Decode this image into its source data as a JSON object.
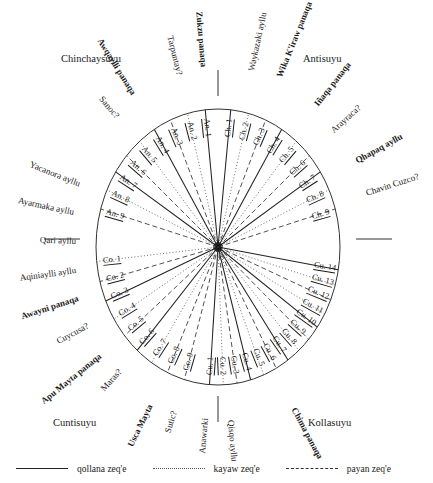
{
  "diagram": {
    "center": {
      "x": 218,
      "y": 247
    },
    "ellipse": {
      "rx": 122,
      "ry": 138
    },
    "colors": {
      "qollana": "#222222",
      "kayaw": "#555555",
      "payan": "#333333",
      "outline": "#333333",
      "text": "#1a1a1a"
    },
    "tick_marks": [
      {
        "name": "tick-top",
        "x1": 218,
        "y1": 70,
        "x2": 218,
        "y2": 96
      },
      {
        "name": "tick-left",
        "x1": 44,
        "y1": 239,
        "x2": 80,
        "y2": 239
      },
      {
        "name": "tick-right",
        "x1": 356,
        "y1": 239,
        "x2": 392,
        "y2": 239
      },
      {
        "name": "tick-bottom",
        "x1": 218,
        "y1": 396,
        "x2": 218,
        "y2": 422
      }
    ]
  },
  "suyus": [
    {
      "label": "Chinchaysuyu",
      "x": 61,
      "y": 53
    },
    {
      "label": "Antisuyu",
      "x": 303,
      "y": 53
    },
    {
      "label": "Cuntisuyu",
      "x": 53,
      "y": 417
    },
    {
      "label": "Kollasuyu",
      "x": 308,
      "y": 417
    }
  ],
  "outer_labels": [
    {
      "text": "Wika K'iraw panaqa",
      "kind": "panaqa",
      "angle": -68,
      "radius": 183,
      "rot": -68
    },
    {
      "text": "Waykazaki ayllu",
      "kind": "ayllu",
      "angle": -78,
      "radius": 180,
      "rot": -78
    },
    {
      "text": "Zukzu panaqa",
      "kind": "panaqa",
      "angle": -95,
      "radius": 181,
      "rot": -95
    },
    {
      "text": "Tarpuntay?",
      "kind": "ayllu",
      "angle": -104,
      "radius": 177,
      "rot": -104
    },
    {
      "text": "Awqaylli panaqa",
      "kind": "panaqa",
      "angle": -122,
      "radius": 180,
      "rot": -122
    },
    {
      "text": "Sanoc?",
      "kind": "ayllu",
      "angle": -131,
      "radius": 172,
      "rot": -131
    },
    {
      "text": "Iñaqa panaqa",
      "kind": "panaqa",
      "angle": -52,
      "radius": 180,
      "rot": -52
    },
    {
      "text": "Arayraca?",
      "kind": "ayllu",
      "angle": -42,
      "radius": 174,
      "rot": -42
    },
    {
      "text": "Qhapaq ayllu",
      "kind": "panaqa",
      "angle": -29,
      "radius": 178,
      "rot": -29
    },
    {
      "text": "Chavin Cuzco?",
      "kind": "ayllu",
      "angle": -18,
      "radius": 176,
      "rot": -18
    },
    {
      "text": "Yacanora ayllu",
      "kind": "ayllu",
      "angle": -158,
      "radius": 168,
      "rot": -158
    },
    {
      "text": "Ayarmaka ayllu",
      "kind": "ayllu",
      "angle": -168,
      "radius": 167,
      "rot": -168
    },
    {
      "text": "Qari ayllu",
      "kind": "ayllu",
      "angle": -178,
      "radius": 161,
      "rot": -178
    },
    {
      "text": "Aqiniaylli ayllu",
      "kind": "ayllu",
      "angle": 172,
      "radius": 162,
      "rot": 172
    },
    {
      "text": "Awayni panaqa",
      "kind": "panaqa",
      "angle": 162,
      "radius": 166,
      "rot": 162
    },
    {
      "text": "Cuycusa?",
      "kind": "ayllu",
      "angle": 152,
      "radius": 166,
      "rot": 152
    },
    {
      "text": "Apu Mayta panaqa",
      "kind": "panaqa",
      "angle": 141,
      "radius": 172,
      "rot": 141
    },
    {
      "text": "Maras?",
      "kind": "ayllu",
      "angle": 132,
      "radius": 166,
      "rot": 132
    },
    {
      "text": "Usca Mayta",
      "kind": "panaqa",
      "angle": 116,
      "radius": 176,
      "rot": 116
    },
    {
      "text": "Sutic?",
      "kind": "ayllu",
      "angle": 107,
      "radius": 172,
      "rot": 107
    },
    {
      "text": "Anawarki",
      "kind": "ayllu",
      "angle": 95,
      "radius": 172,
      "rot": 95
    },
    {
      "text": "Qisqo ayllu",
      "kind": "ayllu",
      "angle": 85,
      "radius": 174,
      "rot": 85
    },
    {
      "text": "Chima panaqa",
      "kind": "panaqa",
      "angle": 62,
      "radius": 182,
      "rot": 62
    }
  ],
  "chart_data": {
    "type": "radial-diagram",
    "groups": [
      {
        "prefix": "Ch.",
        "name": "Chinchaysuyu",
        "count": 9
      },
      {
        "prefix": "An.",
        "name": "Antisuyu",
        "count": 9
      },
      {
        "prefix": "Co.",
        "name": "Kollasuyu",
        "count": 9
      },
      {
        "prefix": "Cu.",
        "name": "Cuntisuyu",
        "count": 14
      }
    ],
    "rays": [
      {
        "label": "Ch. 1",
        "angle": -84.0,
        "type": "qollana"
      },
      {
        "label": "Ch. 2",
        "angle": -75.5,
        "type": "kayaw"
      },
      {
        "label": "Ch. 3",
        "angle": -67.0,
        "type": "payan"
      },
      {
        "label": "Ch. 4",
        "angle": -58.5,
        "type": "qollana"
      },
      {
        "label": "Ch. 5",
        "angle": -50.0,
        "type": "kayaw"
      },
      {
        "label": "Ch. 6",
        "angle": -41.5,
        "type": "payan"
      },
      {
        "label": "Ch. 7",
        "angle": -33.0,
        "type": "qollana"
      },
      {
        "label": "Ch. 8",
        "angle": -24.5,
        "type": "kayaw"
      },
      {
        "label": "Ch. 9",
        "angle": -16.0,
        "type": "payan"
      },
      {
        "label": "An. 1",
        "angle": -96.0,
        "type": "qollana"
      },
      {
        "label": "An. 2",
        "angle": -104.5,
        "type": "kayaw"
      },
      {
        "label": "An. 3",
        "angle": -113.0,
        "type": "payan"
      },
      {
        "label": "An. 4",
        "angle": -121.5,
        "type": "qollana"
      },
      {
        "label": "An. 5",
        "angle": -130.0,
        "type": "kayaw"
      },
      {
        "label": "An. 6",
        "angle": -138.5,
        "type": "payan"
      },
      {
        "label": "An. 7",
        "angle": -147.0,
        "type": "qollana"
      },
      {
        "label": "An. 8",
        "angle": -155.5,
        "type": "kayaw"
      },
      {
        "label": "An. 9",
        "angle": -164.0,
        "type": "payan"
      },
      {
        "label": "Co. 1",
        "angle": 174.0,
        "type": "kayaw"
      },
      {
        "label": "Co. 2",
        "angle": 165.5,
        "type": "payan"
      },
      {
        "label": "Co. 3",
        "angle": 157.0,
        "type": "qollana"
      },
      {
        "label": "Co. 4",
        "angle": 148.5,
        "type": "kayaw"
      },
      {
        "label": "Co. 5",
        "angle": 140.0,
        "type": "payan"
      },
      {
        "label": "Co. 6",
        "angle": 131.5,
        "type": "qollana"
      },
      {
        "label": "Co. 7",
        "angle": 123.0,
        "type": "kayaw"
      },
      {
        "label": "Co. 8",
        "angle": 114.5,
        "type": "payan"
      },
      {
        "label": "Co. 9",
        "angle": 106.0,
        "type": "payan"
      },
      {
        "label": "Cu. 1",
        "angle": 94.0,
        "type": "qollana"
      },
      {
        "label": "Cu. 2",
        "angle": 87.5,
        "type": "kayaw"
      },
      {
        "label": "Cu. 3",
        "angle": 81.0,
        "type": "payan"
      },
      {
        "label": "Cu. 4",
        "angle": 74.5,
        "type": "qollana"
      },
      {
        "label": "Cu. 5",
        "angle": 68.0,
        "type": "kayaw"
      },
      {
        "label": "Cu. 6",
        "angle": 61.5,
        "type": "payan"
      },
      {
        "label": "Cu. 7",
        "angle": 55.0,
        "type": "qollana"
      },
      {
        "label": "Cu. 8",
        "angle": 48.5,
        "type": "kayaw"
      },
      {
        "label": "Cu. 9",
        "angle": 42.0,
        "type": "payan"
      },
      {
        "label": "Cu. 10",
        "angle": 35.5,
        "type": "qollana"
      },
      {
        "label": "Cu. 11",
        "angle": 29.0,
        "type": "kayaw"
      },
      {
        "label": "Cu. 12",
        "angle": 22.5,
        "type": "payan"
      },
      {
        "label": "Cu. 13",
        "angle": 16.0,
        "type": "kayaw"
      },
      {
        "label": "Cu. 14",
        "angle": 9.5,
        "type": "qollana"
      }
    ]
  },
  "legend": {
    "items": [
      {
        "label": "qollana zeq'e",
        "style": "solid",
        "key": "qollana"
      },
      {
        "label": "kayaw zeq'e",
        "style": "dotted",
        "key": "kayaw"
      },
      {
        "label": "payan zeq'e",
        "style": "dashed",
        "key": "payan"
      }
    ]
  }
}
